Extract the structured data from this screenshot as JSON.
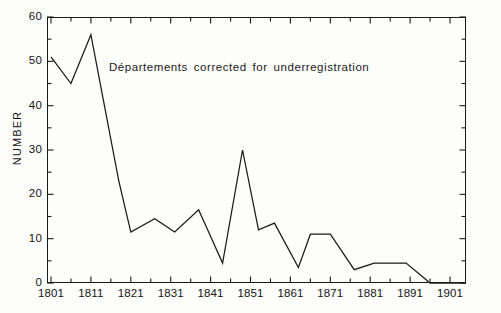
{
  "chart_data": {
    "type": "line",
    "title": "",
    "xlabel": "",
    "ylabel": "NUMBER",
    "xlim": [
      1800,
      1905
    ],
    "ylim": [
      0,
      60
    ],
    "grid": false,
    "legend": false,
    "annotations": [
      {
        "text": "Départements corrected for underregistration",
        "x": 1815,
        "y": 51
      }
    ],
    "ytick_labels": [
      "0",
      "10",
      "20",
      "30",
      "40",
      "50",
      "60"
    ],
    "ytick_values": [
      0,
      10,
      20,
      30,
      40,
      50,
      60
    ],
    "yminor_step": 5,
    "xtick_labels": [
      "1801",
      "1811",
      "1821",
      "1831",
      "1841",
      "1851",
      "1861",
      "1871",
      "1881",
      "1891",
      "1901"
    ],
    "xtick_values": [
      1801,
      1811,
      1821,
      1831,
      1841,
      1851,
      1861,
      1871,
      1881,
      1891,
      1901
    ],
    "xminor_step": 5,
    "series": [
      {
        "name": "Number",
        "x": [
          1801,
          1806,
          1811,
          1818,
          1821,
          1827,
          1832,
          1838,
          1844,
          1849,
          1853,
          1857,
          1863,
          1866,
          1871,
          1877,
          1882,
          1890,
          1896,
          1905
        ],
        "values": [
          51,
          45,
          56,
          23,
          11.5,
          14.5,
          11.5,
          16.5,
          4.5,
          30,
          12,
          13.5,
          3.5,
          11,
          11,
          3,
          4.5,
          4.5,
          0,
          0
        ]
      }
    ]
  },
  "style": {
    "line_color": "#1a1a1a",
    "axis_color": "#1a1a1a",
    "background": "#fdfdfc",
    "text_color": "#141414"
  }
}
